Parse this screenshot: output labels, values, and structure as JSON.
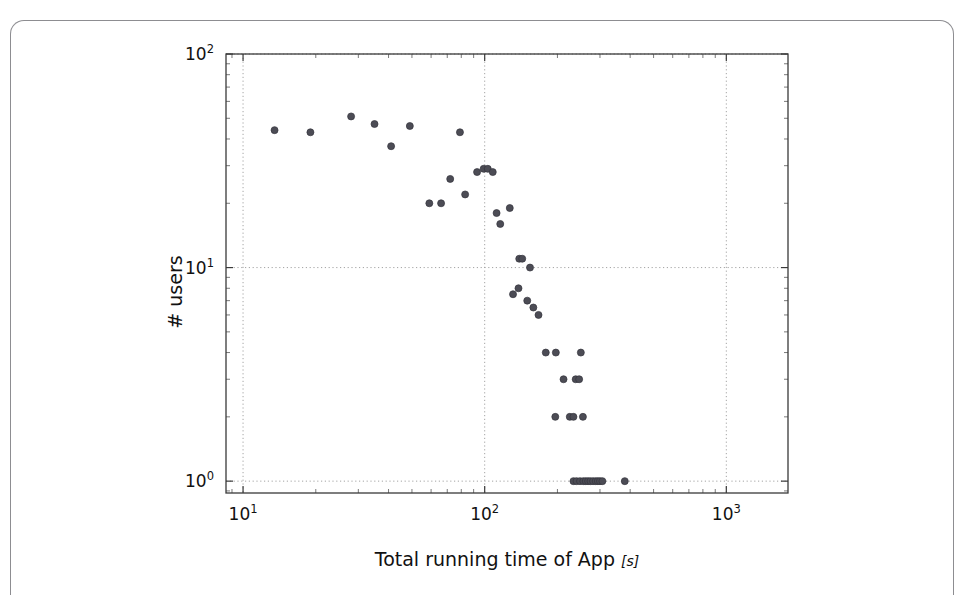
{
  "figure": {
    "background": "#ffffff",
    "card_border_color": "#8d8d91",
    "marker_color": "#4c4c55",
    "grid_color": "#9a9a9a",
    "axis_color": "#3a3a3a"
  },
  "labels": {
    "xlabel_text": "Total running time of App",
    "xlabel_unit": "[s]",
    "xlabel_full": "Total running time of App [s]",
    "ylabel_full": "# users",
    "x_tick_labels": [
      "10¹",
      "10²",
      "10³"
    ],
    "y_tick_labels": [
      "10⁰",
      "10¹",
      "10²"
    ]
  },
  "chart_data": {
    "type": "scatter",
    "title": "",
    "xlabel": "Total running time of App [s]",
    "ylabel": "# users",
    "xscale": "log",
    "yscale": "log",
    "xlim": [
      8.5,
      1800
    ],
    "ylim": [
      0.88,
      100
    ],
    "grid": true,
    "legend": "none",
    "marker": "circle",
    "marker_size": 7,
    "x_ticks": [
      10,
      100,
      1000
    ],
    "y_ticks": [
      1,
      10,
      100
    ],
    "points": [
      {
        "x": 13.5,
        "y": 44
      },
      {
        "x": 19.0,
        "y": 43
      },
      {
        "x": 28.0,
        "y": 51
      },
      {
        "x": 35.0,
        "y": 47
      },
      {
        "x": 41.0,
        "y": 37
      },
      {
        "x": 49.0,
        "y": 46
      },
      {
        "x": 59.0,
        "y": 20
      },
      {
        "x": 66.0,
        "y": 20
      },
      {
        "x": 72.0,
        "y": 26
      },
      {
        "x": 79.0,
        "y": 43
      },
      {
        "x": 83.0,
        "y": 22
      },
      {
        "x": 93.0,
        "y": 28
      },
      {
        "x": 99.0,
        "y": 29
      },
      {
        "x": 103.0,
        "y": 29
      },
      {
        "x": 108.0,
        "y": 28
      },
      {
        "x": 112.0,
        "y": 18
      },
      {
        "x": 116.0,
        "y": 16
      },
      {
        "x": 127.0,
        "y": 19
      },
      {
        "x": 131.0,
        "y": 7.5
      },
      {
        "x": 139.0,
        "y": 11
      },
      {
        "x": 143.0,
        "y": 11
      },
      {
        "x": 154.0,
        "y": 10
      },
      {
        "x": 138.0,
        "y": 8
      },
      {
        "x": 150.0,
        "y": 7
      },
      {
        "x": 159.0,
        "y": 6.5
      },
      {
        "x": 167.0,
        "y": 6.0
      },
      {
        "x": 179.0,
        "y": 4
      },
      {
        "x": 197.0,
        "y": 4
      },
      {
        "x": 250.0,
        "y": 4
      },
      {
        "x": 212.0,
        "y": 3
      },
      {
        "x": 238.0,
        "y": 3
      },
      {
        "x": 246.0,
        "y": 3
      },
      {
        "x": 196.0,
        "y": 2
      },
      {
        "x": 225.0,
        "y": 2
      },
      {
        "x": 233.0,
        "y": 2
      },
      {
        "x": 255.0,
        "y": 2
      },
      {
        "x": 233.0,
        "y": 1
      },
      {
        "x": 240.0,
        "y": 1
      },
      {
        "x": 248.0,
        "y": 1
      },
      {
        "x": 256.0,
        "y": 1
      },
      {
        "x": 262.0,
        "y": 1
      },
      {
        "x": 268.0,
        "y": 1
      },
      {
        "x": 274.0,
        "y": 1
      },
      {
        "x": 281.0,
        "y": 1
      },
      {
        "x": 288.0,
        "y": 1
      },
      {
        "x": 294.0,
        "y": 1
      },
      {
        "x": 300.0,
        "y": 1
      },
      {
        "x": 307.0,
        "y": 1
      },
      {
        "x": 380.0,
        "y": 1
      }
    ]
  }
}
